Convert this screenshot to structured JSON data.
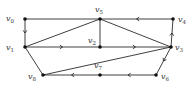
{
  "diagram": {
    "type": "directed-graph",
    "nodes": [
      {
        "id": "v0",
        "label": "v",
        "sub": "0",
        "x": 25,
        "y": 19,
        "lx": 6,
        "ly": 21
      },
      {
        "id": "v1",
        "label": "v",
        "sub": "1",
        "x": 25,
        "y": 47,
        "lx": 6,
        "ly": 50
      },
      {
        "id": "v2",
        "label": "v",
        "sub": "2",
        "x": 100,
        "y": 47,
        "lx": 88,
        "ly": 43
      },
      {
        "id": "v3",
        "label": "v",
        "sub": "3",
        "x": 171,
        "y": 47,
        "lx": 175,
        "ly": 50
      },
      {
        "id": "v4",
        "label": "v",
        "sub": "4",
        "x": 173,
        "y": 19,
        "lx": 178,
        "ly": 22
      },
      {
        "id": "v5",
        "label": "v",
        "sub": "5",
        "x": 100,
        "y": 19,
        "lx": 95,
        "ly": 12
      },
      {
        "id": "v6",
        "label": "v",
        "sub": "6",
        "x": 156,
        "y": 75,
        "lx": 161,
        "ly": 79
      },
      {
        "id": "v7",
        "label": "v",
        "sub": "7",
        "x": 100,
        "y": 75,
        "lx": 94,
        "ly": 68
      },
      {
        "id": "v8",
        "label": "v",
        "sub": "8",
        "x": 43,
        "y": 75,
        "lx": 28,
        "ly": 79
      }
    ],
    "edges": [
      {
        "from": "v0",
        "to": "v5",
        "directed": false
      },
      {
        "from": "v0",
        "to": "v1",
        "directed": true
      },
      {
        "from": "v1",
        "to": "v5",
        "directed": false
      },
      {
        "from": "v1",
        "to": "v2",
        "directed": true
      },
      {
        "from": "v1",
        "to": "v8",
        "directed": false
      },
      {
        "from": "v5",
        "to": "v2",
        "directed": false
      },
      {
        "from": "v5",
        "to": "v3",
        "directed": false
      },
      {
        "from": "v4",
        "to": "v5",
        "directed": true
      },
      {
        "from": "v3",
        "to": "v4",
        "directed": true
      },
      {
        "from": "v2",
        "to": "v3",
        "directed": true
      },
      {
        "from": "v3",
        "to": "v6",
        "directed": true
      },
      {
        "from": "v8",
        "to": "v3",
        "directed": false
      },
      {
        "from": "v7",
        "to": "v8",
        "directed": true
      },
      {
        "from": "v6",
        "to": "v7",
        "directed": true
      }
    ]
  }
}
